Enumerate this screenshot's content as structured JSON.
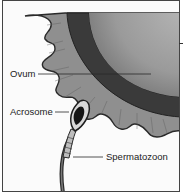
{
  "diagram": {
    "labels": {
      "ovum": "Ovum",
      "acrosome": "Acrosome",
      "spermatozoon": "Spermatozoon"
    },
    "colors": {
      "ovum_fill": "#9a9a9a",
      "ovum_membrane": "#3a3a3a",
      "corona": "#8c8c8c",
      "outline": "#2a2a2a",
      "background": "#fbfbfb"
    }
  }
}
